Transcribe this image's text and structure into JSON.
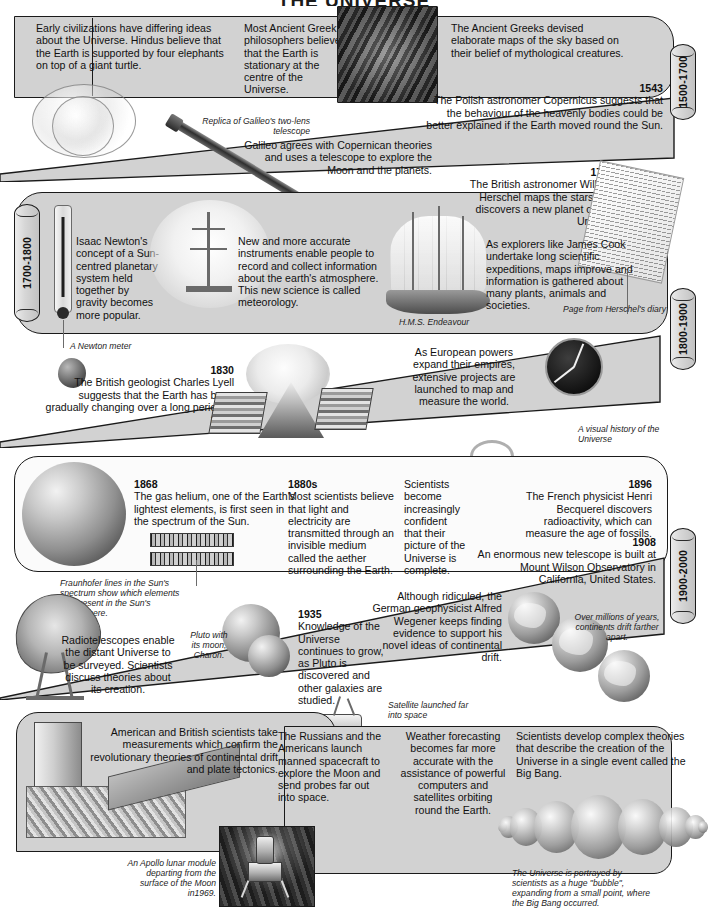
{
  "title": "THE UNIVERSE",
  "eras": [
    {
      "id": "era-1500-1700",
      "label": "1500-1700"
    },
    {
      "id": "era-1700-1800",
      "label": "1700-1800"
    },
    {
      "id": "era-1800-1900",
      "label": "1800-1900"
    },
    {
      "id": "era-1900-2000",
      "label": "1900-2000"
    }
  ],
  "entries": {
    "early_civilizations": "Early civilizations have differing ideas about the Universe. Hindus believe that the Earth is supported by four elephants on top of a giant turtle.",
    "greek_philosophers": "Most Ancient Greek philosophers believe that the Earth is stationary at the centre of the Universe.",
    "greek_sky_maps": "The Ancient Greeks devised elaborate maps of the sky based on their belief of mythological creatures.",
    "copernicus_year": "1543",
    "copernicus": "The Polish astronomer Copernicus suggests that the behaviour of the heavenly bodies could be better explained if the Earth moved round the Sun.",
    "galileo": "Galileo agrees with Copernican theories and uses a telescope to explore the Moon and the planets.",
    "herschel_year": "1781",
    "herschel": "The British astronomer William Herschel maps the stars and discovers a new planet called Uranus.",
    "newton": "Isaac Newton's concept of a Sun-centred planetary system held together by gravity becomes more popular.",
    "meteorology": "New and more accurate instruments enable people to record and collect information about the earth's atmosphere. This new science is called meteorology.",
    "explorers": "As explorers like James Cook undertake long scientific expeditions, maps improve and information is gathered about many plants, animals and societies.",
    "lyell_year": "1830",
    "lyell": "The British geologist Charles Lyell suggests that the Earth has been gradually changing over a long period of time.",
    "empires": "As European powers expand their empires, extensive projects are launched to map and measure the world.",
    "helium_year": "1868",
    "helium": "The gas helium, one of the Earth's lightest elements, is first seen in the spectrum of the Sun.",
    "aether_year": "1880s",
    "aether": "Most scientists believe that light and electricity are transmitted through an invisible medium called the aether surrounding the Earth.",
    "confidence": "Scientists become increasingly confident that their picture of the Universe is complete.",
    "becquerel_year": "1896",
    "becquerel": "The French physicist Henri Becquerel discovers radioactivity, which can measure the age of fossils.",
    "mount_wilson_year": "1908",
    "mount_wilson": "An enormous new telescope is built at Mount Wilson Observatory in California, United States.",
    "radiotelescopes": "Radiotelescopes enable the distant Universe to be surveyed. Scientists discuss theories about its creation.",
    "pluto_year": "1935",
    "pluto": "Knowledge of the Universe continues to grow, as Pluto is discovered and other galaxies are studied.",
    "wegener": "Although ridiculed, the German geophysicist Alfred Wegener keeps finding evidence to support his novel ideas of continental drift.",
    "plate_tectonics": "American and British scientists take measurements which confirm the revolutionary theories of continental drift and plate tectonics.",
    "space_race": "The Russians and the Americans launch manned spacecraft to explore the Moon and send probes far out into space.",
    "weather": "Weather forecasting becomes far more accurate with the assistance of powerful computers and satellites orbiting round the Earth.",
    "big_bang": "Scientists develop complex theories that describe the creation of the Universe in a single event called the Big Bang."
  },
  "captions": {
    "galileo_telescope": "Replica of Galileo's two-lens telescope",
    "newton_meter": "A Newton meter",
    "endeavour": "H.M.S. Endeavour",
    "herschel_diary": "Page from Herschel's diary",
    "visual_history": "A visual history of the Universe",
    "fraunhofer": "Fraunhofer lines in the Sun's spectrum show which elements are present in the Sun's atmosphere.",
    "pluto_charon": "Pluto with its moon, Charon.",
    "continents_drift": "Over millions of years, continents drift farther apart.",
    "satellite": "Satellite launched far into space",
    "apollo": "An Apollo lunar module departing from the surface of the Moon in1969.",
    "bubble_universe": "The Universe is portrayed by scientists as a huge \"bubble\", expanding from a small point, where the Big Bang occurred."
  },
  "colors": {
    "band_fill": "#d2d2d2",
    "band_stroke": "#1a1a1a",
    "page_bg": "#ffffff",
    "text": "#101010"
  }
}
